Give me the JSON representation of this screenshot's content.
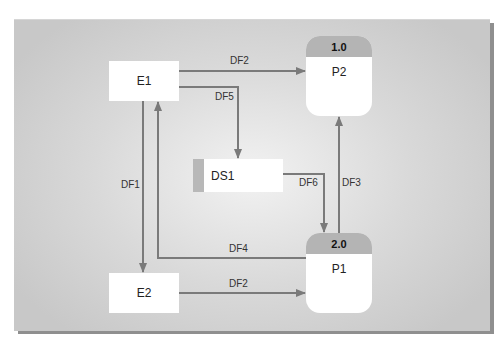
{
  "diagram": {
    "entities": [
      {
        "id": "E1",
        "label": "E1"
      },
      {
        "id": "E2",
        "label": "E2"
      }
    ],
    "processes": [
      {
        "id": "P2",
        "number": "1.0",
        "label": "P2"
      },
      {
        "id": "P1",
        "number": "2.0",
        "label": "P1"
      }
    ],
    "data_store": {
      "id": "DS1",
      "label": "DS1"
    },
    "flows": [
      {
        "label": "DF2",
        "from": "E1",
        "to": "P2"
      },
      {
        "label": "DF5",
        "from": "E1",
        "to": "DS1"
      },
      {
        "label": "DF1",
        "from": "E1",
        "to": "E2"
      },
      {
        "label": "DF6",
        "from": "DS1",
        "to": "P1"
      },
      {
        "label": "DF3",
        "from": "P1",
        "to": "P2"
      },
      {
        "label": "DF4",
        "from": "P1",
        "to": "E1"
      },
      {
        "label": "DF2",
        "from": "E2",
        "to": "P1"
      }
    ],
    "colors": {
      "line": "#7a7a7a",
      "process_header": "#b4b4b4",
      "box": "#ffffff"
    }
  }
}
